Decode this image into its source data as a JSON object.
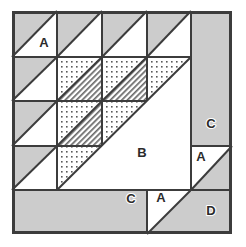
{
  "figure": {
    "kind": "quilt-block-diagram",
    "canvas": {
      "width": 246,
      "height": 247
    },
    "block": {
      "x": 12,
      "y": 11,
      "width": 220,
      "height": 223
    }
  },
  "colors": {
    "background": "#ffffff",
    "fabric_light": "#ffffff",
    "fabric_gray": "#cccccc",
    "fabric_dotted_base": "#ffffff",
    "fabric_dotted_ink": "#5a5a5a",
    "fabric_hatched_base": "#ffffff",
    "fabric_hatched_ink": "#5a5a5a",
    "outline": "#3c3c3c",
    "label_text": "#2b2b2b",
    "label_halo": "#ffffff"
  },
  "strokes": {
    "outer_border": 3,
    "grid_line": 2,
    "diagonal_line": 2
  },
  "grid": {
    "columns": [
      12,
      57,
      102,
      147,
      191,
      232
    ],
    "rows": [
      11,
      57,
      101,
      146,
      190,
      234
    ],
    "unit_cells_across": 4,
    "unit_cells_down": 4
  },
  "legend": {
    "fabrics": [
      {
        "key": "light",
        "name": "Light / background fabric",
        "swatch": "#ffffff"
      },
      {
        "key": "gray",
        "name": "Medium gray fabric",
        "swatch": "#cccccc"
      },
      {
        "key": "dotted",
        "name": "Dotted print fabric",
        "swatch": "#ffffff"
      },
      {
        "key": "hatched",
        "name": "Diagonal stripe fabric",
        "swatch": "#ffffff"
      }
    ]
  },
  "labels": [
    {
      "id": "label-a-top-left",
      "text": "A",
      "x": 44,
      "y": 44
    },
    {
      "id": "label-b-center",
      "text": "B",
      "x": 142,
      "y": 154
    },
    {
      "id": "label-c-right",
      "text": "C",
      "x": 211,
      "y": 125
    },
    {
      "id": "label-a-right",
      "text": "A",
      "x": 201,
      "y": 158
    },
    {
      "id": "label-c-bottom",
      "text": "C",
      "x": 131,
      "y": 200
    },
    {
      "id": "label-a-bottom",
      "text": "A",
      "x": 161,
      "y": 199
    },
    {
      "id": "label-d-bottom-right",
      "text": "D",
      "x": 211,
      "y": 212
    }
  ],
  "pieces": {
    "row1_half_square_triangles": [
      {
        "id": "hst-r1c1",
        "cell": [
          12,
          11,
          57,
          57
        ],
        "gray_corner": "top-left",
        "light_corner": "bottom-right",
        "label": "A"
      },
      {
        "id": "hst-r1c2",
        "cell": [
          57,
          11,
          102,
          57
        ],
        "gray_corner": "top-left",
        "light_corner": "bottom-right",
        "label": ""
      },
      {
        "id": "hst-r1c3",
        "cell": [
          102,
          11,
          147,
          57
        ],
        "gray_corner": "top-left",
        "light_corner": "bottom-right",
        "label": ""
      },
      {
        "id": "hst-r1c4",
        "cell": [
          147,
          11,
          191,
          57
        ],
        "gray_corner": "top-left",
        "light_corner": "bottom-right",
        "label": ""
      }
    ],
    "row2": [
      {
        "id": "hst-r2c1",
        "cell": [
          12,
          57,
          57,
          101
        ],
        "gray_corner": "top-left",
        "light_corner": "bottom-right"
      },
      {
        "id": "dot-hatch-r2c2",
        "cell": [
          57,
          57,
          102,
          101
        ],
        "upper_left": "dotted",
        "lower_right": "hatched"
      },
      {
        "id": "dot-hatch-r2c3",
        "cell": [
          102,
          57,
          147,
          101
        ],
        "upper_left": "dotted",
        "lower_right": "hatched"
      },
      {
        "id": "dot-light-r2c4",
        "cell": [
          147,
          57,
          191,
          101
        ],
        "upper_left": "dotted",
        "lower_right": "light"
      }
    ],
    "row3": [
      {
        "id": "hst-r3c1",
        "cell": [
          12,
          101,
          57,
          146
        ],
        "gray_corner": "top-left",
        "light_corner": "bottom-right"
      },
      {
        "id": "dot-hatch-r3c2",
        "cell": [
          57,
          101,
          102,
          146
        ],
        "upper_left": "dotted",
        "lower_right": "hatched"
      },
      {
        "id": "dot-light-r3c3",
        "cell": [
          102,
          101,
          147,
          146
        ],
        "upper_left": "dotted",
        "lower_right": "light"
      }
    ],
    "row4": [
      {
        "id": "hst-r4c1",
        "cell": [
          12,
          146,
          57,
          190
        ],
        "gray_corner": "top-left",
        "light_corner": "bottom-right"
      },
      {
        "id": "dot-light-r4c2",
        "cell": [
          57,
          146,
          102,
          190
        ],
        "upper_left": "dotted",
        "lower_right": "light"
      }
    ],
    "large_light_triangle": {
      "id": "piece-b",
      "label": "B",
      "points": "57,190 191,57 191,190",
      "fabric": "light"
    },
    "right_column": {
      "rectangle_c": {
        "id": "piece-c-right",
        "label": "C",
        "rect": [
          191,
          11,
          232,
          146
        ],
        "fabric": "gray"
      },
      "hst_a": {
        "id": "piece-a-right",
        "label": "A",
        "cell": [
          191,
          146,
          232,
          190
        ],
        "light_corner": "top-left",
        "gray_corner": "bottom-right"
      }
    },
    "bottom_strip": {
      "rectangle_c": {
        "id": "piece-c-bottom",
        "label": "C",
        "rect": [
          12,
          190,
          147,
          234
        ],
        "fabric": "gray"
      },
      "hst_a": {
        "id": "piece-a-bottom",
        "label": "A",
        "cell": [
          147,
          190,
          191,
          234
        ],
        "light_corner": "top-left",
        "gray_corner": "bottom-right"
      },
      "square_d": {
        "id": "piece-d",
        "label": "D",
        "rect": [
          191,
          190,
          232,
          234
        ],
        "fabric": "gray"
      }
    }
  }
}
